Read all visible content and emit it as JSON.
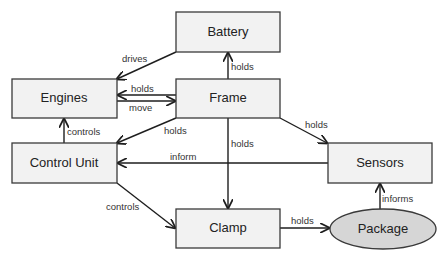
{
  "diagram": {
    "type": "component-relationship",
    "nodes": [
      {
        "id": "battery",
        "label": "Battery",
        "shape": "rectangle"
      },
      {
        "id": "engines",
        "label": "Engines",
        "shape": "rectangle"
      },
      {
        "id": "frame",
        "label": "Frame",
        "shape": "rectangle"
      },
      {
        "id": "control_unit",
        "label": "Control Unit",
        "shape": "rectangle"
      },
      {
        "id": "sensors",
        "label": "Sensors",
        "shape": "rectangle"
      },
      {
        "id": "clamp",
        "label": "Clamp",
        "shape": "rectangle"
      },
      {
        "id": "package",
        "label": "Package",
        "shape": "ellipse"
      }
    ],
    "edges": [
      {
        "from": "battery",
        "to": "engines",
        "label": "drives"
      },
      {
        "from": "frame",
        "to": "battery",
        "label": "holds"
      },
      {
        "from": "frame",
        "to": "engines",
        "label": "holds"
      },
      {
        "from": "engines",
        "to": "frame",
        "label": "move"
      },
      {
        "from": "control_unit",
        "to": "engines",
        "label": "controls"
      },
      {
        "from": "frame",
        "to": "control_unit",
        "label": "holds"
      },
      {
        "from": "frame",
        "to": "clamp",
        "label": "holds"
      },
      {
        "from": "frame",
        "to": "sensors",
        "label": "holds"
      },
      {
        "from": "sensors",
        "to": "control_unit",
        "label": "inform"
      },
      {
        "from": "control_unit",
        "to": "clamp",
        "label": "controls"
      },
      {
        "from": "clamp",
        "to": "package",
        "label": "holds"
      },
      {
        "from": "package",
        "to": "sensors",
        "label": "informs"
      }
    ]
  },
  "colors": {
    "box_fill": "#f2f2f2",
    "ellipse_fill": "#d6d6d6",
    "stroke": "#3a3a3a"
  }
}
